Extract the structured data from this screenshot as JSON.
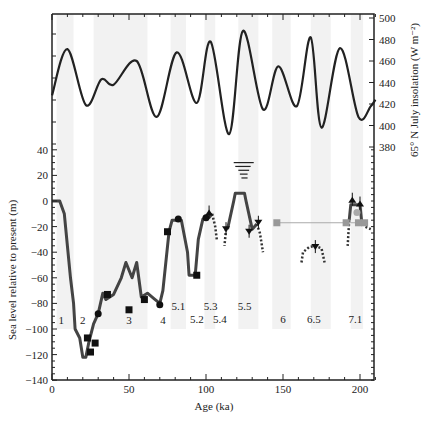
{
  "chart_data": {
    "type": "line",
    "title": "",
    "xlabel": "Age (ka)",
    "ylabel": "Sea level relative to present (m)",
    "ylabel_right": "65° N July insolation (W m⁻²)",
    "xlim": [
      0,
      210
    ],
    "ylim": [
      -140,
      40
    ],
    "ylim_right": [
      380,
      500
    ],
    "x_ticks": [
      0,
      50,
      100,
      150,
      200
    ],
    "y_ticks": [
      -140,
      -120,
      -100,
      -80,
      -60,
      -40,
      -20,
      0,
      20,
      40
    ],
    "y_ticks_right": [
      380,
      400,
      420,
      440,
      460,
      480,
      500
    ],
    "grid": false,
    "shaded_bands_ka": [
      [
        3,
        14
      ],
      [
        27,
        62
      ],
      [
        77,
        87
      ],
      [
        99,
        106
      ],
      [
        121,
        134
      ],
      [
        143,
        155
      ],
      [
        168,
        181
      ],
      [
        194,
        202
      ]
    ],
    "stage_labels": [
      {
        "label": "1",
        "x": 6,
        "y": -93
      },
      {
        "label": "2",
        "x": 20,
        "y": -93
      },
      {
        "label": "3",
        "x": 50,
        "y": -93
      },
      {
        "label": "4",
        "x": 72,
        "y": -93
      },
      {
        "label": "5.1",
        "x": 82,
        "y": -82
      },
      {
        "label": "5.2",
        "x": 94,
        "y": -92
      },
      {
        "label": "5.3",
        "x": 103,
        "y": -82
      },
      {
        "label": "5.4",
        "x": 109,
        "y": -92
      },
      {
        "label": "5.5",
        "x": 125,
        "y": -82
      },
      {
        "label": "6",
        "x": 150,
        "y": -92
      },
      {
        "label": "6.5",
        "x": 170,
        "y": -92
      },
      {
        "label": "7.1",
        "x": 197,
        "y": -92
      }
    ],
    "series": [
      {
        "name": "65N July insolation",
        "axis": "right",
        "x": [
          0,
          10,
          22,
          32,
          40,
          55,
          68,
          81,
          94,
          103,
          115,
          124,
          137,
          147,
          159,
          168,
          175,
          187,
          199,
          207,
          210
        ],
        "values": [
          428,
          471,
          419,
          443,
          438,
          460,
          408,
          468,
          421,
          478,
          392,
          488,
          415,
          455,
          418,
          482,
          398,
          472,
          408,
          418,
          424
        ]
      },
      {
        "name": "Sea level reconstruction",
        "axis": "left",
        "x": [
          0,
          5,
          8,
          10,
          12,
          14,
          15,
          18,
          20,
          22,
          24,
          27,
          30,
          33,
          35,
          40,
          45,
          48,
          52,
          55,
          58,
          62,
          66,
          70,
          72,
          76,
          78,
          84,
          88,
          89,
          93,
          95,
          98,
          102,
          104
        ],
        "values": [
          0,
          0,
          -10,
          -35,
          -60,
          -80,
          -100,
          -107,
          -122,
          -122,
          -110,
          -96,
          -88,
          -72,
          -77,
          -73,
          -60,
          -48,
          -60,
          -48,
          -75,
          -72,
          -76,
          -80,
          -70,
          -24,
          -15,
          -15,
          -40,
          -58,
          -58,
          -30,
          -14,
          -13,
          -10
        ]
      },
      {
        "name": "Sea level MIS 5.5",
        "axis": "left",
        "x": [
          114,
          118,
          119,
          125,
          126,
          130,
          133
        ],
        "values": [
          -22,
          0,
          6,
          6,
          0,
          -22,
          -18
        ]
      },
      {
        "name": "Sea level MIS 7.1",
        "axis": "left",
        "x": [
          193,
          194,
          200,
          201
        ],
        "values": [
          -15,
          -3,
          -3,
          -15
        ]
      }
    ],
    "markers": {
      "squares_black": [
        [
          23,
          -107
        ],
        [
          25,
          -118
        ],
        [
          28,
          -111
        ],
        [
          36,
          -73
        ],
        [
          50,
          -85
        ],
        [
          60,
          -77
        ],
        [
          75,
          -24
        ],
        [
          94,
          -58
        ]
      ],
      "circles_black": [
        [
          30,
          -88
        ],
        [
          70,
          -81
        ],
        [
          82,
          -14
        ],
        [
          100,
          -13
        ]
      ],
      "triangles_down": [
        [
          113,
          -22
        ],
        [
          128,
          -24
        ],
        [
          134,
          -17
        ],
        [
          171,
          -36
        ]
      ],
      "triangles_up": [
        [
          102,
          -9
        ],
        [
          195,
          1
        ],
        [
          200,
          -2
        ]
      ],
      "squares_grey": [
        [
          146,
          -17
        ],
        [
          191,
          -17
        ],
        [
          199,
          -17
        ],
        [
          203,
          -17
        ]
      ],
      "circle_grey": [
        [
          198,
          -9
        ]
      ],
      "reference_line_y": -17,
      "sea_level_highstand_bars": [
        [
          118,
          131,
          30
        ],
        [
          119,
          129,
          27
        ],
        [
          121,
          128,
          24
        ],
        [
          122,
          127,
          21
        ],
        [
          123,
          127,
          18
        ]
      ]
    }
  }
}
